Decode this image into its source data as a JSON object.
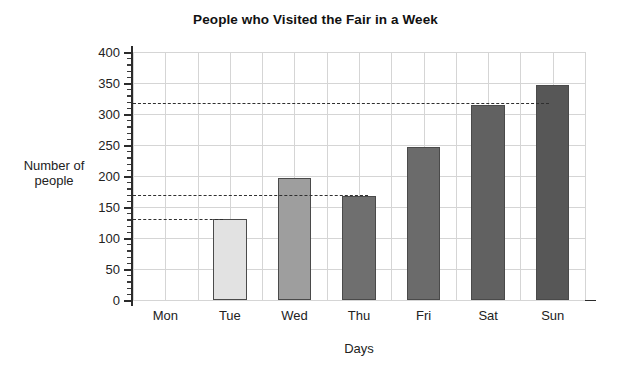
{
  "chart_data": {
    "type": "bar",
    "title": "People who Visited the Fair in a Week",
    "xlabel": "Days",
    "ylabel": "Number of people",
    "ylabel_lines": [
      "Number of",
      "people"
    ],
    "categories": [
      "Mon",
      "Tue",
      "Wed",
      "Thu",
      "Fri",
      "Sat",
      "Sun"
    ],
    "values": [
      0,
      130,
      197,
      168,
      246,
      315,
      347
    ],
    "bar_colors": [
      "#ffffff",
      "#e2e2e2",
      "#9e9e9e",
      "#6f6f6f",
      "#6b6b6b",
      "#616161",
      "#575757"
    ],
    "bar_edge_color": "#4a4a4a",
    "ylim": [
      0,
      400
    ],
    "yticks": [
      0,
      50,
      100,
      150,
      200,
      250,
      300,
      350,
      400
    ],
    "ytick_labels": [
      "0",
      "50",
      "100",
      "150",
      "200",
      "250",
      "300",
      "350",
      "400"
    ],
    "yminor_step": 10,
    "grid": "both",
    "grid_color": "#d5d5d5",
    "legend": "none",
    "reference_lines": [
      {
        "value": 318,
        "style": "dashed",
        "color": "#2f2f2f",
        "x_start_frac": 0.0,
        "x_end_frac": 0.92
      },
      {
        "value": 170,
        "style": "dashed",
        "color": "#2f2f2f",
        "x_start_frac": 0.0,
        "x_end_frac": 0.52
      },
      {
        "value": 130,
        "style": "dashed",
        "color": "#2f2f2f",
        "x_start_frac": 0.0,
        "x_end_frac": 0.2
      }
    ]
  }
}
